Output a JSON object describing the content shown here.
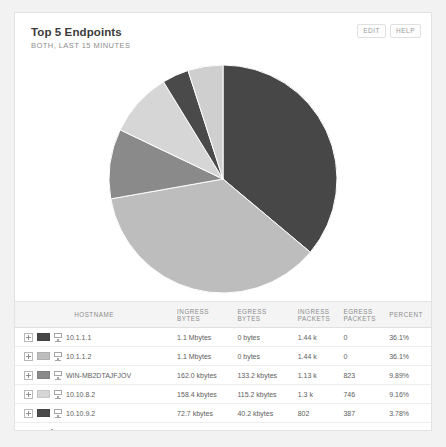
{
  "header": {
    "title": "Top 5 Endpoints",
    "subtitle": "BOTH, LAST 15 MINUTES",
    "edit_label": "EDIT",
    "help_label": "HELP"
  },
  "table": {
    "columns": [
      {
        "line1": "HOSTNAME",
        "line2": ""
      },
      {
        "line1": "INGRESS",
        "line2": "BYTES"
      },
      {
        "line1": "EGRESS",
        "line2": "BYTES"
      },
      {
        "line1": "INGRESS",
        "line2": "PACKETS"
      },
      {
        "line1": "EGRESS",
        "line2": "PACKETS"
      },
      {
        "line1": "PERCENT",
        "line2": ""
      }
    ],
    "rows": [
      {
        "hostname": "10.1.1.1",
        "ingress_bytes": "1.1 Mbytes",
        "egress_bytes": "0 bytes",
        "ingress_packets": "1.44 k",
        "egress_packets": "0",
        "percent": "36.1%",
        "color": "#474747",
        "icon": "host-icon",
        "expandable": true
      },
      {
        "hostname": "10.1.1.2",
        "ingress_bytes": "1.1 Mbytes",
        "egress_bytes": "0 bytes",
        "ingress_packets": "1.44 k",
        "egress_packets": "0",
        "percent": "36.1%",
        "color": "#bdbdbd",
        "icon": "host-icon",
        "expandable": true
      },
      {
        "hostname": "WIN-MB2DTAJFJOV",
        "ingress_bytes": "162.0 kbytes",
        "egress_bytes": "133.2 kbytes",
        "ingress_packets": "1.13 k",
        "egress_packets": "823",
        "percent": "9.89%",
        "color": "#8a8a8a",
        "icon": "host-icon",
        "expandable": true
      },
      {
        "hostname": "10.10.8.2",
        "ingress_bytes": "158.4 kbytes",
        "egress_bytes": "115.2 kbytes",
        "ingress_packets": "1.3 k",
        "egress_packets": "746",
        "percent": "9.16%",
        "color": "#d6d6d6",
        "icon": "host-icon",
        "expandable": true
      },
      {
        "hostname": "10.10.9.2",
        "ingress_bytes": "72.7 kbytes",
        "egress_bytes": "40.2 kbytes",
        "ingress_packets": "802",
        "egress_packets": "387",
        "percent": "3.78%",
        "color": "#4a4a4a",
        "icon": "host-icon",
        "expandable": true
      },
      {
        "hostname": "Remaining traffic",
        "ingress_bytes": "90.0 kbytes",
        "egress_bytes": "58.2 kbytes",
        "ingress_packets": "799",
        "egress_packets": "464",
        "percent": "4.96%",
        "color": "",
        "icon": "bar-chart-icon",
        "expandable": false
      }
    ]
  },
  "chart_data": {
    "type": "pie",
    "title": "Top 5 Endpoints",
    "subtitle": "BOTH, LAST 15 MINUTES",
    "labels": [
      "10.1.1.1",
      "10.1.1.2",
      "WIN-MB2DTAJFJOV",
      "10.10.8.2",
      "10.10.9.2",
      "Remaining traffic"
    ],
    "values": [
      36.1,
      36.1,
      9.89,
      9.16,
      3.78,
      4.96
    ],
    "value_unit": "percent",
    "colors": [
      "#474747",
      "#bdbdbd",
      "#8a8a8a",
      "#d6d6d6",
      "#4a4a4a",
      "#cfcfcf"
    ],
    "start_angle_deg": 0,
    "direction": "clockwise",
    "legend": "table",
    "grid": false
  }
}
